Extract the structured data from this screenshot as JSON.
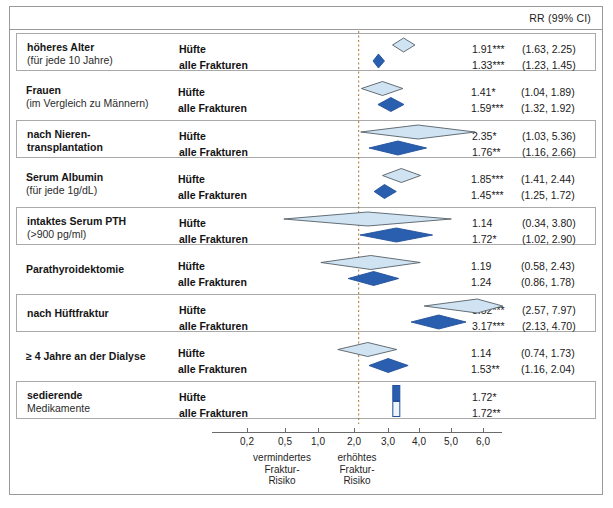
{
  "header": {
    "rr_label": "RR (99% CI)"
  },
  "axis": {
    "ticks": [
      {
        "label": "0,2",
        "value": 0.2,
        "x": 247
      },
      {
        "label": "0,5",
        "value": 0.5,
        "x": 285
      },
      {
        "label": "1,0",
        "value": 1.0,
        "x": 318
      },
      {
        "label": "2,0",
        "value": 2.0,
        "x": 354
      },
      {
        "label": "3,0",
        "value": 3.0,
        "x": 388
      },
      {
        "label": "4,0",
        "value": 4.0,
        "x": 419
      },
      {
        "label": "5,0",
        "value": 5.0,
        "x": 451
      },
      {
        "label": "6,0",
        "value": 6.0,
        "x": 483
      }
    ],
    "left_caption": "vermindertes\nFraktur-\nRisiko",
    "left_caption_lines": [
      "vermindertes",
      "Fraktur-",
      "Risiko"
    ],
    "right_caption_lines": [
      "erhöhtes",
      "Fraktur-",
      "Risiko"
    ],
    "null_value": 1.0
  },
  "colors": {
    "hip_fill": "#cfe3f2",
    "hip_stroke": "#555f66",
    "all_fill": "#2a5fb0",
    "all_stroke": "#23509a",
    "null_line": "#b0702a",
    "border": "#9a9a9a"
  },
  "chart_data": {
    "type": "forest",
    "title": "",
    "xlabel": "RR (99% CI)",
    "xscale": "log",
    "xlim": [
      0.2,
      6.5
    ],
    "grid": false,
    "null_line": 1.0,
    "legend": [
      "Hüfte",
      "alle Frakturen"
    ],
    "outcomes": [
      "Hüfte",
      "alle Frakturen"
    ],
    "rows": [
      {
        "label_bold": "höheres Alter",
        "label_note": "(für jede 10 Jahre)",
        "boxed": true,
        "entries": [
          {
            "outcome": "Hüfte",
            "est": 1.91,
            "lo": 1.63,
            "hi": 2.25,
            "stars": "***",
            "est_text": "1.91",
            "ci_text": "(1.63, 2.25)"
          },
          {
            "outcome": "alle Frakturen",
            "est": 1.33,
            "lo": 1.23,
            "hi": 1.45,
            "stars": "***",
            "est_text": "1.33",
            "ci_text": "(1.23, 1.45)"
          }
        ]
      },
      {
        "label_bold": "Frauen",
        "label_note": "(im Vergleich zu Männern)",
        "boxed": false,
        "entries": [
          {
            "outcome": "Hüfte",
            "est": 1.41,
            "lo": 1.04,
            "hi": 1.89,
            "stars": "*",
            "est_text": "1.41",
            "ci_text": "(1.04, 1.89)"
          },
          {
            "outcome": "alle Frakturen",
            "est": 1.59,
            "lo": 1.32,
            "hi": 1.92,
            "stars": "***",
            "est_text": "1.59",
            "ci_text": "(1.32, 1.92)"
          }
        ]
      },
      {
        "label_bold": "nach Nieren-",
        "label_note": "transplantation",
        "label_note_bold": true,
        "boxed": true,
        "entries": [
          {
            "outcome": "Hüfte",
            "est": 2.35,
            "lo": 1.03,
            "hi": 5.36,
            "stars": "*",
            "est_text": "2.35",
            "ci_text": "(1.03, 5.36)"
          },
          {
            "outcome": "alle Frakturen",
            "est": 1.76,
            "lo": 1.16,
            "hi": 2.66,
            "stars": "**",
            "est_text": "1.76",
            "ci_text": "(1.16, 2.66)"
          }
        ]
      },
      {
        "label_bold": "Serum Albumin",
        "label_note": "(für jede 1g/dL)",
        "boxed": false,
        "entries": [
          {
            "outcome": "Hüfte",
            "est": 1.85,
            "lo": 1.41,
            "hi": 2.44,
            "stars": "***",
            "est_text": "1.85",
            "ci_text": "(1.41, 2.44)"
          },
          {
            "outcome": "alle Frakturen",
            "est": 1.45,
            "lo": 1.25,
            "hi": 1.72,
            "stars": "***",
            "est_text": "1.45",
            "ci_text": "(1.25, 1.72)"
          }
        ]
      },
      {
        "label_bold": "intaktes Serum PTH",
        "label_note": "(>900 pg/ml)",
        "boxed": true,
        "entries": [
          {
            "outcome": "Hüfte",
            "est": 1.14,
            "lo": 0.34,
            "hi": 3.8,
            "stars": "",
            "est_text": "1.14",
            "ci_text": "(0.34, 3.80)"
          },
          {
            "outcome": "alle Frakturen",
            "est": 1.72,
            "lo": 1.02,
            "hi": 2.9,
            "stars": "*",
            "est_text": "1.72",
            "ci_text": "(1.02, 2.90)"
          }
        ]
      },
      {
        "label_bold": "Parathyroidektomie",
        "label_note": "",
        "boxed": false,
        "entries": [
          {
            "outcome": "Hüfte",
            "est": 1.19,
            "lo": 0.58,
            "hi": 2.43,
            "stars": "",
            "est_text": "1.19",
            "ci_text": "(0.58, 2.43)"
          },
          {
            "outcome": "alle Frakturen",
            "est": 1.24,
            "lo": 0.86,
            "hi": 1.78,
            "stars": "",
            "est_text": "1.24",
            "ci_text": "(0.86, 1.78)"
          }
        ]
      },
      {
        "label_bold": "nach Hüftfraktur",
        "label_note": "",
        "boxed": true,
        "entries": [
          {
            "outcome": "Hüfte",
            "est": 5.52,
            "lo": 2.57,
            "hi": 7.97,
            "stars": "***",
            "est_text": "5.52",
            "ci_text": "(2.57, 7.97)"
          },
          {
            "outcome": "alle Frakturen",
            "est": 3.17,
            "lo": 2.13,
            "hi": 4.7,
            "stars": "***",
            "est_text": "3.17",
            "ci_text": "(2.13, 4.70)"
          }
        ]
      },
      {
        "label_bold": "≥ 4 Jahre an der Dialyse",
        "label_note": "",
        "boxed": false,
        "entries": [
          {
            "outcome": "Hüfte",
            "est": 1.14,
            "lo": 0.74,
            "hi": 1.73,
            "stars": "",
            "est_text": "1.14",
            "ci_text": "(0.74, 1.73)"
          },
          {
            "outcome": "alle Frakturen",
            "est": 1.53,
            "lo": 1.16,
            "hi": 2.04,
            "stars": "**",
            "est_text": "1.53",
            "ci_text": "(1.16, 2.04)"
          }
        ]
      },
      {
        "label_bold": "sedierende",
        "label_note": "Medikamente",
        "boxed": true,
        "entries": [
          {
            "outcome": "Hüfte",
            "est": 1.72,
            "lo": 1.72,
            "hi": 1.72,
            "stars": "*",
            "est_text": "1.72",
            "ci_text": ""
          },
          {
            "outcome": "alle Frakturen",
            "est": 1.72,
            "lo": 1.72,
            "hi": 1.72,
            "stars": "**",
            "est_text": "1.72",
            "ci_text": ""
          }
        ]
      }
    ]
  }
}
